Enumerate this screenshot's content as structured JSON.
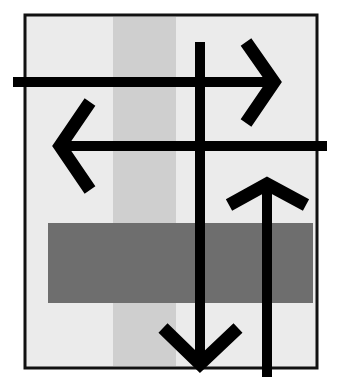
{
  "figure": {
    "colors": {
      "background": "#ffffff",
      "panel": "#ebebeb",
      "frame": "#111111",
      "column": "#cfcfcf",
      "band": "#6e6e6e",
      "arrow": "#000000"
    },
    "arrows": [
      {
        "direction": "right"
      },
      {
        "direction": "left"
      },
      {
        "direction": "up"
      },
      {
        "direction": "down"
      }
    ]
  }
}
